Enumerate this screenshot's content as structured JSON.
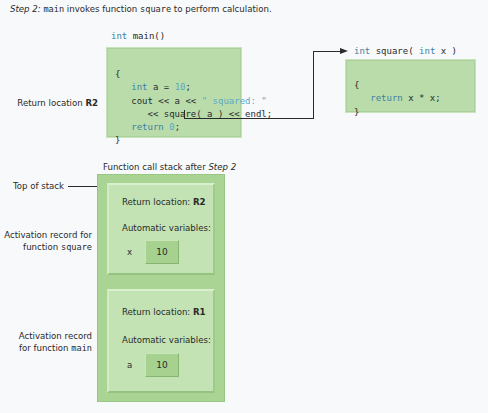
{
  "caption": {
    "step": "Step 2:",
    "fn_main": "main",
    "text1": "invokes function",
    "fn_square": "square",
    "text2": "to perform calculation."
  },
  "main_function": {
    "signature_kw": "int",
    "signature_name": "main()",
    "lines": {
      "open": "{",
      "l1_kw": "int",
      "l1_rest": " a = ",
      "l1_num": "10",
      "l1_end": ";",
      "l2_a": "cout << a << ",
      "l2_str": "\" squared: \"",
      "l3": "<< square( a ) << endl;",
      "l4_kw": "return",
      "l4_num": "0",
      "l4_end": ";",
      "close": "}"
    }
  },
  "square_function": {
    "signature_kw1": "int",
    "signature_name": " square( ",
    "signature_kw2": "int",
    "signature_end": " x )",
    "lines": {
      "open": "{",
      "l1_kw": "return",
      "l1_rest": " x * x;",
      "close": "}"
    }
  },
  "labels": {
    "return_location": "Return location",
    "return_location_id": "R2",
    "stack_title": "Function call stack after",
    "stack_title_step": "Step 2",
    "top_of_stack": "Top of stack",
    "ar_square_line1": "Activation record for",
    "ar_square_line2": "function",
    "ar_square_fn": "square",
    "ar_main_line1": "Activation record",
    "ar_main_line2": "for function",
    "ar_main_fn": "main"
  },
  "stack": {
    "records": [
      {
        "return_label": "Return location:",
        "return_id": "R2",
        "auto_label": "Automatic variables:",
        "var_name": "x",
        "var_value": "10"
      },
      {
        "return_label": "Return location:",
        "return_id": "R1",
        "auto_label": "Automatic variables:",
        "var_name": "a",
        "var_value": "10"
      }
    ]
  },
  "colors": {
    "code_box": "#b9dcaa",
    "stack_outer": "#a9d494",
    "record": "#c3e3b4",
    "keyword": "#3f7fa3",
    "literal": "#5aa9c9"
  }
}
